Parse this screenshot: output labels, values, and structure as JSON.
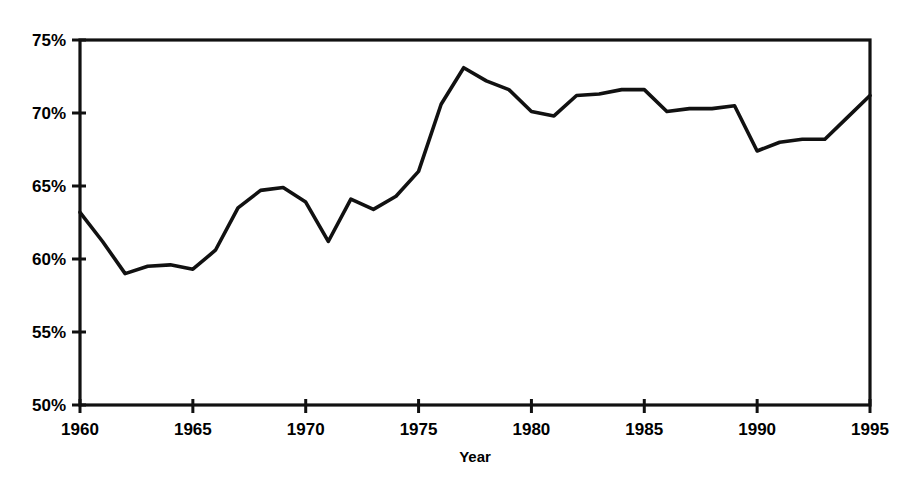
{
  "chart_data": {
    "type": "line",
    "title": "",
    "subtitle": "",
    "xlabel": "Year",
    "ylabel": "",
    "xlim": [
      1960,
      1995
    ],
    "ylim": [
      50,
      75
    ],
    "grid": true,
    "legend": false,
    "legend_position": "none",
    "line_color": "#111111",
    "background_color": "#ffffff",
    "x_tick_labels": [
      "1960",
      "1965",
      "1970",
      "1975",
      "1980",
      "1985",
      "1990",
      "1995"
    ],
    "x_ticks": [
      1960,
      1965,
      1970,
      1975,
      1980,
      1985,
      1990,
      1995
    ],
    "y_tick_labels": [
      "50%",
      "55%",
      "60%",
      "65%",
      "70%",
      "75%"
    ],
    "y_ticks": [
      50,
      55,
      60,
      65,
      70,
      75
    ],
    "x": [
      1960,
      1961,
      1962,
      1963,
      1964,
      1965,
      1966,
      1967,
      1968,
      1969,
      1970,
      1971,
      1972,
      1973,
      1974,
      1975,
      1976,
      1977,
      1978,
      1979,
      1980,
      1981,
      1982,
      1983,
      1984,
      1985,
      1986,
      1987,
      1988,
      1989,
      1990,
      1991,
      1992,
      1993,
      1994,
      1995
    ],
    "values": [
      63.2,
      61.2,
      59.0,
      59.5,
      59.6,
      59.3,
      60.6,
      63.5,
      64.7,
      64.9,
      63.9,
      61.2,
      64.1,
      63.4,
      64.3,
      66.0,
      70.6,
      73.1,
      72.2,
      71.6,
      70.1,
      69.8,
      71.2,
      71.3,
      71.6,
      71.6,
      70.1,
      70.3,
      70.3,
      70.5,
      67.4,
      68.0,
      68.2,
      68.2,
      69.7,
      71.2
    ],
    "series": [
      {
        "name": "series-1",
        "values": [
          63.2,
          61.2,
          59.0,
          59.5,
          59.6,
          59.3,
          60.6,
          63.5,
          64.7,
          64.9,
          63.9,
          61.2,
          64.1,
          63.4,
          64.3,
          66.0,
          70.6,
          73.1,
          72.2,
          71.6,
          70.1,
          69.8,
          71.2,
          71.3,
          71.6,
          71.6,
          70.1,
          70.3,
          70.3,
          70.5,
          67.4,
          68.0,
          68.2,
          68.2,
          69.7,
          71.2
        ]
      }
    ]
  }
}
